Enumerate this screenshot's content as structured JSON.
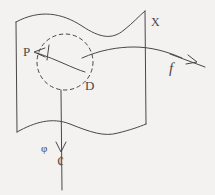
{
  "figure": {
    "kind": "hand-drawn-math-diagram",
    "background_color": "#f3f2f0",
    "ink_color": "#4a4846",
    "stroke_width": 1,
    "labels": {
      "p": "P",
      "d": "D",
      "x": "X",
      "f": "f",
      "phi": "φ",
      "cent": "¢"
    },
    "elements": {
      "sheet": "wavy-sheet-outline",
      "neighborhood": "dashed-circle",
      "p_arrow": "leftward-arrow",
      "f_arrow": "rightward-arrow",
      "phi_arrow": "downward-arrow",
      "fiber_curve": "horizontal-curve"
    }
  }
}
